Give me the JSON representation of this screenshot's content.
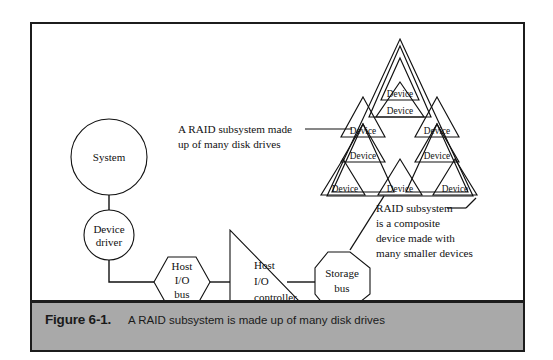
{
  "figure": {
    "caption_label": "Figure 6-1.",
    "caption_text": "A RAID subsystem is made up of many disk drives"
  },
  "nodes": {
    "system": {
      "label": "System"
    },
    "device_driver": {
      "line1": "Device",
      "line2": "driver"
    },
    "host_io_bus": {
      "line1": "Host",
      "line2": "I/O",
      "line3": "bus"
    },
    "host_io_controller": {
      "line1": "Host",
      "line2": "I/O",
      "line3": "controller"
    },
    "storage_bus": {
      "line1": "Storage",
      "line2": "bus"
    }
  },
  "raid": {
    "device_label": "Device",
    "devices": [
      {
        "id": "device-1",
        "label": "Device"
      },
      {
        "id": "device-2",
        "label": "Device"
      },
      {
        "id": "device-3",
        "label": "Device"
      },
      {
        "id": "device-4",
        "label": "Device"
      },
      {
        "id": "device-5",
        "label": "Device"
      },
      {
        "id": "device-6",
        "label": "Device"
      },
      {
        "id": "device-7",
        "label": "Device"
      },
      {
        "id": "device-8",
        "label": "Device"
      }
    ]
  },
  "annotations": {
    "left": {
      "line1": "A RAID subsystem made",
      "line2": "up of many disk drives"
    },
    "right": {
      "line1": "RAID subsystem",
      "line2": "is a composite",
      "line3": "device made with",
      "line4": "many smaller devices"
    }
  },
  "colors": {
    "ink": "#111111",
    "frame": "#1c1c1c",
    "caption_bar": "#a9a9a9",
    "page": "#ffffff"
  }
}
